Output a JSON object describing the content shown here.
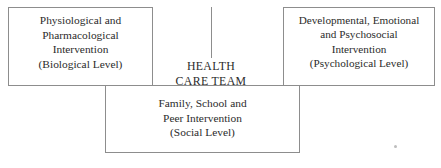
{
  "diagram": {
    "center": {
      "name": "health-care-team",
      "lines": [
        "HEALTH",
        "CARE TEAM"
      ]
    },
    "nodes": [
      {
        "id": "biological",
        "lines": [
          "Physiological and",
          "Pharmacological",
          "Intervention",
          "(Biological Level)"
        ]
      },
      {
        "id": "psychological",
        "lines": [
          "Developmental, Emotional",
          "and Psychosocial",
          "Intervention",
          "(Psychological Level)"
        ]
      },
      {
        "id": "social",
        "lines": [
          "Family, School and",
          "Peer Intervention",
          "(Social Level)"
        ]
      }
    ],
    "style": {
      "line_color": "#8d8d8d",
      "text_color": "#2b2b2b",
      "background": "#ffffff"
    }
  }
}
